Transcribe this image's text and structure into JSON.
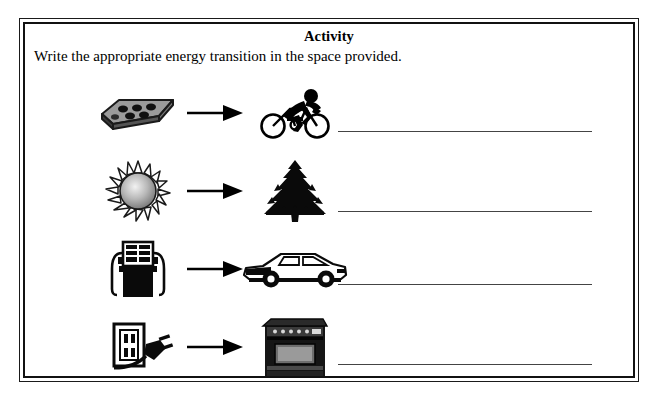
{
  "worksheet": {
    "title": "Activity",
    "instruction": "Write the appropriate energy transition in the space provided.",
    "rows": [
      {
        "source_icon": "chocolate-bar-icon",
        "source_label": "chocolate bar",
        "arrow_icon": "right-arrow-icon",
        "target_icon": "cyclist-icon",
        "target_label": "cyclist",
        "answer_value": ""
      },
      {
        "source_icon": "sun-icon",
        "source_label": "sun",
        "arrow_icon": "right-arrow-icon",
        "target_icon": "tree-icon",
        "target_label": "tree",
        "answer_value": ""
      },
      {
        "source_icon": "gas-pump-icon",
        "source_label": "gas pump",
        "arrow_icon": "right-arrow-icon",
        "target_icon": "car-icon",
        "target_label": "car",
        "answer_value": ""
      },
      {
        "source_icon": "electrical-outlet-plug-icon",
        "source_label": "electrical outlet with plug",
        "arrow_icon": "right-arrow-icon",
        "target_icon": "stove-icon",
        "target_label": "stove",
        "answer_value": ""
      }
    ],
    "colors": {
      "border": "#111111",
      "text": "#000000",
      "answer_line": "#444444",
      "page_background": "#ffffff"
    }
  }
}
